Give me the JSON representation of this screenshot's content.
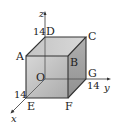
{
  "figure": {
    "type": "3d-cube-coordinate-diagram",
    "vertices": {
      "O": "O",
      "A": "A",
      "B": "B",
      "C": "C",
      "D": "D",
      "E": "E",
      "F": "F",
      "G": "G"
    },
    "axes": {
      "x": "x",
      "y": "y",
      "z": "z"
    },
    "dimensions": {
      "x_length": "14",
      "y_length": "14",
      "z_length": "14"
    },
    "colors": {
      "front_face": "#b8b8b8",
      "top_face": "#c8c8c8",
      "side_face": "#a4a4a4",
      "edge": "#333333"
    }
  }
}
